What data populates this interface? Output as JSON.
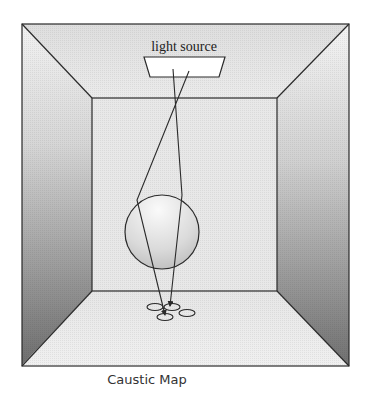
{
  "figure": {
    "caption": "Caustic Map",
    "light_label": "light source",
    "objects": {
      "room": "room-box",
      "light": "light-source",
      "sphere": "glass-sphere",
      "caustic": "caustic-spots"
    },
    "colors": {
      "stroke": "#2a2a2a",
      "ceiling": "#e4e4e4",
      "back_wall": "#e8e8e8",
      "floor": "#eaeaea",
      "side_wall_top": "#f2f2f2",
      "side_wall_bottom": "#6e6e6e",
      "sphere_light": "#f6f6f6",
      "sphere_dark": "#b8b8b8"
    }
  }
}
